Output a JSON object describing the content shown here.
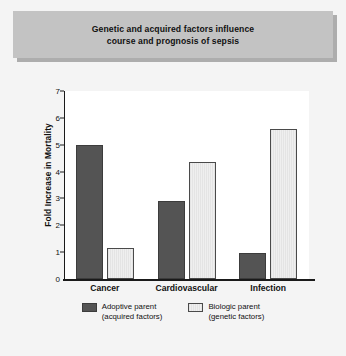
{
  "title": {
    "line1": "Genetic and acquired factors influence",
    "line2": "course and prognosis of sepsis"
  },
  "chart_data": {
    "type": "bar",
    "title": "Genetic and acquired factors influence course and prognosis of sepsis",
    "xlabel": "",
    "ylabel": "Fold Increase in Mortality",
    "ylim": [
      0,
      7
    ],
    "ytick_labels": [
      "0",
      "1",
      "2",
      "3",
      "4",
      "5",
      "6",
      "7"
    ],
    "ytick_values": [
      0,
      1,
      2,
      3,
      4,
      5,
      6,
      7
    ],
    "grid": false,
    "legend_position": "bottom",
    "categories": [
      "Cancer",
      "Cardiovascular",
      "Infection"
    ],
    "series": [
      {
        "name": "Adoptive parent (acquired factors)",
        "name_line1": "Adoptive parent",
        "name_line2": "(acquired factors)",
        "color": "#545454",
        "values": [
          5.0,
          2.9,
          0.95
        ]
      },
      {
        "name": "Biologic parent (genetic factors)",
        "name_line1": "Biologic parent",
        "name_line2": "(genetic factors)",
        "color": "#e9e9e9",
        "values": [
          1.15,
          4.35,
          5.6
        ]
      }
    ]
  },
  "colors": {
    "banner": "#c3c3c3",
    "background": "#f4f4f4",
    "plot_background": "#ffffff",
    "axis": "#1a1a1a",
    "series_dark": "#545454",
    "series_light": "#e9e9e9"
  }
}
